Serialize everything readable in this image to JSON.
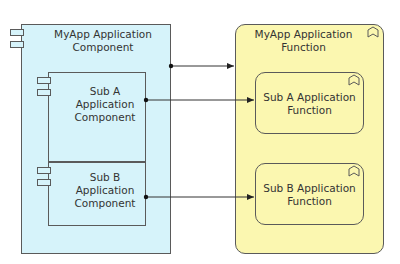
{
  "diagram": {
    "colors": {
      "component_fill": "#d6f3fa",
      "function_fill": "#fbf7b0",
      "stroke": "#5a5a5a"
    },
    "nodes": {
      "myapp_component": {
        "label": "MyApp Application Component",
        "line1": "MyApp Application",
        "line2": "Component",
        "type": "application-component"
      },
      "sub_a_component": {
        "label": "Sub A Application Component",
        "line1": "Sub A",
        "line2": "Application",
        "line3": "Component",
        "type": "application-component"
      },
      "sub_b_component": {
        "label": "Sub B Application Component",
        "line1": "Sub B",
        "line2": "Application",
        "line3": "Component",
        "type": "application-component"
      },
      "myapp_function": {
        "label": "MyApp Application Function",
        "line1": "MyApp Application",
        "line2": "Function",
        "type": "application-function"
      },
      "sub_a_function": {
        "label": "Sub A Application Function",
        "line1": "Sub A Application",
        "line2": "Function",
        "type": "application-function"
      },
      "sub_b_function": {
        "label": "Sub B Application Function",
        "line1": "Sub B Application",
        "line2": "Function",
        "type": "application-function"
      }
    },
    "edges": [
      {
        "from": "MyApp Application Component",
        "to": "MyApp Application Function",
        "type": "assignment"
      },
      {
        "from": "Sub A Application Component",
        "to": "Sub A Application Function",
        "type": "assignment"
      },
      {
        "from": "Sub B Application Component",
        "to": "Sub B Application Function",
        "type": "assignment"
      }
    ]
  }
}
